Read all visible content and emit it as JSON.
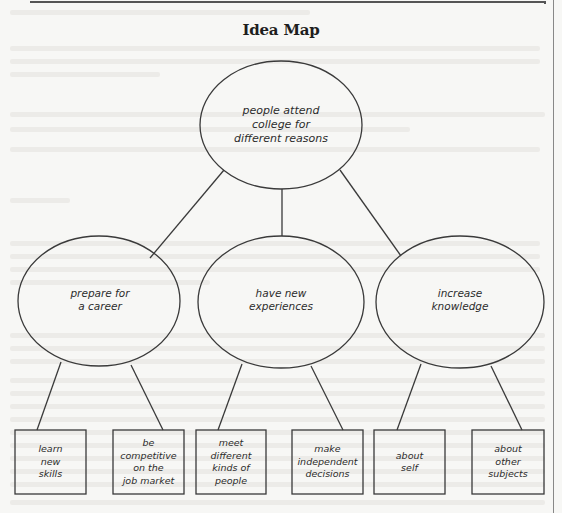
{
  "title": "Idea Map",
  "colors": {
    "background": "#f7f7f5",
    "stroke": "#3a3a3a",
    "text": "#2c2c2c",
    "title": "#1e1e1e"
  },
  "central_node": {
    "label": "people attend\ncollege for\ndifferent reasons"
  },
  "branches": [
    {
      "label": "prepare for\na career",
      "leaves": [
        {
          "label": "learn\nnew\nskills"
        },
        {
          "label": "be\ncompetitive\non the\njob market"
        }
      ]
    },
    {
      "label": "have new\nexperiences",
      "leaves": [
        {
          "label": "meet\ndifferent\nkinds of\npeople"
        },
        {
          "label": "make\nindependent\ndecisions"
        }
      ]
    },
    {
      "label": "increase\nknowledge",
      "leaves": [
        {
          "label": "about\nself"
        },
        {
          "label": "about\nother\nsubjects"
        }
      ]
    }
  ]
}
